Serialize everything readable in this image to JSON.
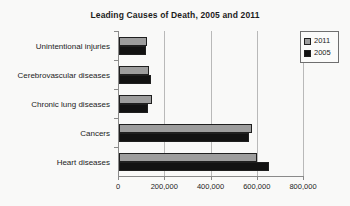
{
  "chart_data": {
    "type": "bar",
    "orientation": "horizontal",
    "title": "Leading Causes of Death, 2005 and 2011",
    "xlabel": "",
    "ylabel": "",
    "categories": [
      "Heart diseases",
      "Cancers",
      "Chronic lung diseases",
      "Cerebrovascular diseases",
      "Unintentional injuries"
    ],
    "series": [
      {
        "name": "2011",
        "color": "#9d9d9d",
        "values": [
          597000,
          575000,
          143000,
          129000,
          122000
        ]
      },
      {
        "name": "2005",
        "color": "#121212",
        "values": [
          650000,
          562000,
          126000,
          138000,
          118000
        ]
      }
    ],
    "xlim": [
      0,
      800000
    ],
    "xticks": [
      0,
      200000,
      400000,
      600000,
      800000
    ],
    "xtick_labels": [
      "0",
      "200,000",
      "400,000",
      "600,000",
      "800,000"
    ],
    "grid": true,
    "grid_axis": "x",
    "legend_position": "top-right"
  },
  "legend": {
    "entries": [
      {
        "label": "2011",
        "swatch": "series-2011-swatch"
      },
      {
        "label": "2005",
        "swatch": "series-2005-swatch"
      }
    ]
  }
}
